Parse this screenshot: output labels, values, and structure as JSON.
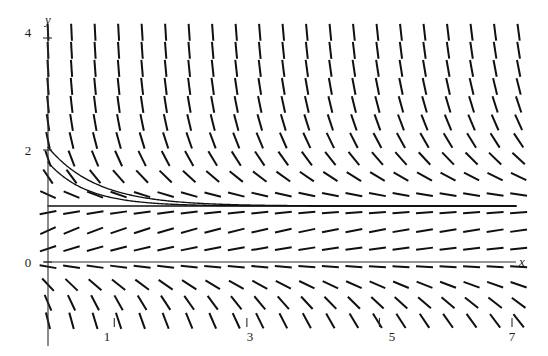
{
  "figure": {
    "kind": "slope-field",
    "background_color": "#ffffff",
    "ink_color": "#101010"
  },
  "chart_data": {
    "type": "line",
    "title": "",
    "subtitle": "",
    "xlabel": "x",
    "ylabel": "y",
    "grid": false,
    "legend": null,
    "xlim": [
      -0.05,
      7.3
    ],
    "ylim": [
      -1.1,
      4.25
    ],
    "xticks": [
      1,
      3,
      5,
      7
    ],
    "xtick_labels": [
      "1",
      "3",
      "5",
      "7"
    ],
    "yticks": [
      0,
      2,
      4
    ],
    "ytick_labels": [
      "0",
      "2",
      "4"
    ],
    "axis_origin": [
      0,
      0
    ],
    "slope_field": {
      "rule": "dy/dx = (1 - y) * (y / (1 + 0.28*x)) scaled",
      "x_start": 0.0,
      "x_end": 7.25,
      "x_step": 0.355,
      "y_start": -1.05,
      "y_end": 4.15,
      "y_step": 0.322,
      "segment_length_px": 17,
      "equilibria": [
        {
          "y": 1,
          "stability": "stable"
        },
        {
          "y": 0,
          "stability": "semi-stable"
        }
      ]
    },
    "series": [
      {
        "name": "solution-curve-upper",
        "initial_point": [
          0.0,
          2.05
        ],
        "asymptote": 1.0,
        "decay_rate": 1.35,
        "values_note": "y = 1 + 1.05 * exp(-1.35 x)"
      },
      {
        "name": "solution-curve-lower",
        "initial_point": [
          0.0,
          1.78
        ],
        "asymptote": 1.0,
        "decay_rate": 1.72,
        "values_note": "y = 1 + 0.78 * exp(-1.72 x)"
      },
      {
        "name": "equilibrium-line-y1",
        "initial_point": [
          0.0,
          1.0
        ],
        "asymptote": 1.0,
        "decay_rate": 0,
        "values_note": "horizontal line y = 1 traced across full width"
      }
    ]
  },
  "axes": {
    "y_axis_label": "y",
    "x_axis_label": "x",
    "y_tick_0": "0",
    "y_tick_2": "2",
    "y_tick_4": "4",
    "x_tick_1": "1",
    "x_tick_3": "3",
    "x_tick_5": "5",
    "x_tick_7": "7"
  }
}
